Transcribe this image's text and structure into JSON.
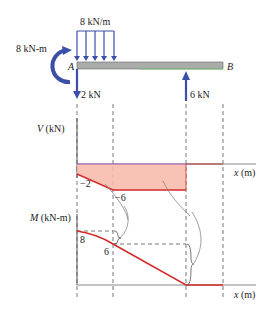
{
  "beam": {
    "left_label": "A",
    "right_label": "B",
    "distributed_load": "8 kN/m",
    "moment_load": "8 kN-m",
    "force_a": "2 kN",
    "force_support": "6 kN"
  },
  "shear_diagram": {
    "axis_label_var": "V",
    "axis_label_unit": "(kN)",
    "x_label_var": "x",
    "x_label_unit": "(m)",
    "value_1": "−2",
    "value_2": "−6"
  },
  "moment_diagram": {
    "axis_label_var": "M",
    "axis_label_unit": "(kN-m)",
    "x_label_var": "x",
    "x_label_unit": "(m)",
    "value_1": "8",
    "value_2": "6"
  },
  "colors": {
    "load_blue": "#3b4fa8",
    "curve_red": "#d42a2a",
    "shear_fill": "#f7b9a8",
    "beam_gray": "#a9aca9",
    "beam_green": "#7fc47a",
    "axis": "#555555"
  }
}
